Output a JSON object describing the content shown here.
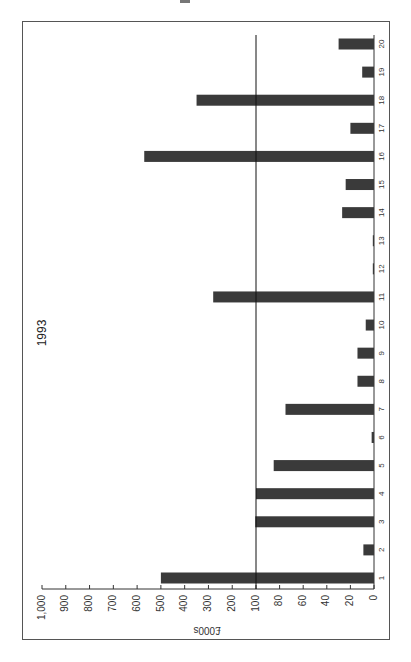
{
  "chart_data": {
    "type": "bar",
    "orientation": "rotated-90 (bars extend leftward from baseline at right)",
    "title": "1993",
    "xlabel": "",
    "ylabel": "£000s",
    "axis_scale": "split: 0-100 linear (step 20), 100-1000 linear (step 100); reference line at 100",
    "tick_labels": [
      "0",
      "20",
      "40",
      "60",
      "80",
      "100",
      "200",
      "300",
      "400",
      "500",
      "600",
      "700",
      "800",
      "900",
      "1,000"
    ],
    "ylim": [
      0,
      1000
    ],
    "grid": false,
    "reference_line": 100,
    "categories": [
      "1",
      "2",
      "3",
      "4",
      "5",
      "6",
      "7",
      "8",
      "9",
      "10",
      "11",
      "12",
      "13",
      "14",
      "15",
      "16",
      "17",
      "18",
      "19",
      "20"
    ],
    "values": [
      500,
      9,
      103,
      100,
      85,
      2,
      75,
      14,
      14,
      7,
      280,
      1,
      1,
      27,
      24,
      570,
      20,
      350,
      10,
      30
    ],
    "bar_color": "#3a3a3a"
  }
}
